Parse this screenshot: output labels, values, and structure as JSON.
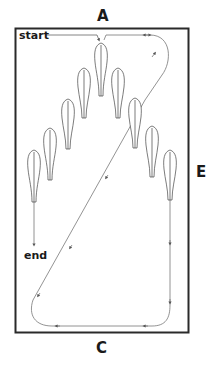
{
  "diagram": {
    "type": "arena-exercise",
    "labels": {
      "top_letter": "A",
      "side_letter": "E",
      "bottom_letter": "C",
      "start": "start",
      "end": "end"
    },
    "colors": {
      "border": "#2a2a2a",
      "path": "#666666",
      "cone_outline": "#444444",
      "text": "#1a1a1a"
    },
    "cones": [
      {
        "id": "center",
        "x": 101,
        "top": 43,
        "bottom": 96
      },
      {
        "id": "left-1",
        "x": 84,
        "top": 68,
        "bottom": 118
      },
      {
        "id": "left-2",
        "x": 68,
        "top": 99,
        "bottom": 149
      },
      {
        "id": "left-3",
        "x": 50,
        "top": 128,
        "bottom": 180
      },
      {
        "id": "left-4",
        "x": 34,
        "top": 150,
        "bottom": 202
      },
      {
        "id": "right-1",
        "x": 118,
        "top": 68,
        "bottom": 118
      },
      {
        "id": "right-2",
        "x": 135,
        "top": 98,
        "bottom": 148
      },
      {
        "id": "right-3",
        "x": 152,
        "top": 126,
        "bottom": 177
      },
      {
        "id": "right-4",
        "x": 170,
        "top": 150,
        "bottom": 200
      }
    ]
  }
}
